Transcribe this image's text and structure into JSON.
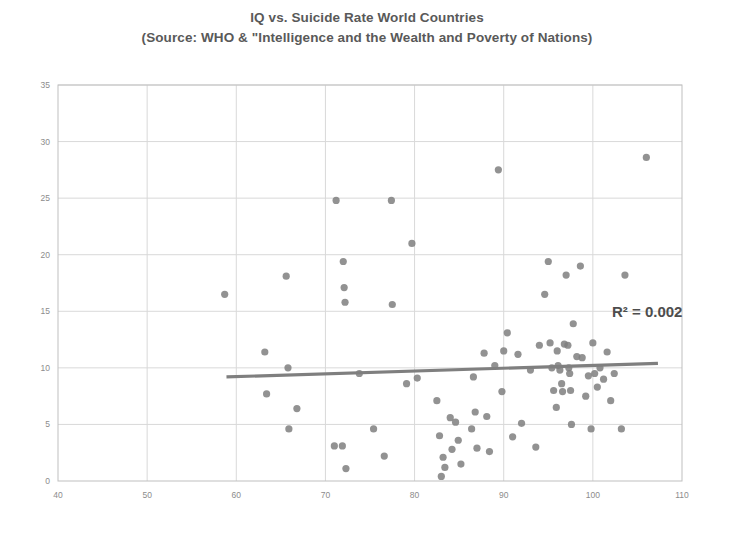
{
  "chart_data": {
    "type": "scatter",
    "title": "IQ vs. Suicide Rate World Countries",
    "subtitle": "(Source: WHO & \"Intelligence and the Wealth and Poverty of Nations)",
    "xlabel": "",
    "ylabel": "",
    "xlim": [
      40,
      110
    ],
    "ylim": [
      0,
      35
    ],
    "xticks": [
      40,
      50,
      60,
      70,
      80,
      90,
      100,
      110
    ],
    "yticks": [
      0,
      5,
      10,
      15,
      20,
      25,
      30,
      35
    ],
    "grid": true,
    "legend": false,
    "annotations": [
      {
        "text": "R² = 0.002",
        "x": 97.5,
        "y": 13.9
      }
    ],
    "marker_color": "#7f7f7f",
    "trendline": {
      "color": "#7f7f7f",
      "x0": 58.9,
      "y0": 9.2,
      "x1": 107.3,
      "y1": 10.4,
      "r_squared": 0.002
    },
    "points": [
      [
        58.7,
        16.5
      ],
      [
        63.2,
        11.4
      ],
      [
        63.4,
        7.7
      ],
      [
        65.6,
        18.1
      ],
      [
        65.8,
        10.0
      ],
      [
        65.9,
        4.6
      ],
      [
        66.8,
        6.4
      ],
      [
        71.0,
        3.1
      ],
      [
        71.2,
        24.8
      ],
      [
        71.9,
        3.1
      ],
      [
        72.0,
        19.4
      ],
      [
        72.1,
        17.1
      ],
      [
        72.2,
        15.8
      ],
      [
        72.3,
        1.1
      ],
      [
        73.8,
        9.5
      ],
      [
        75.4,
        4.6
      ],
      [
        76.6,
        2.2
      ],
      [
        77.4,
        24.8
      ],
      [
        77.5,
        15.6
      ],
      [
        79.1,
        8.6
      ],
      [
        79.7,
        21.0
      ],
      [
        80.3,
        9.1
      ],
      [
        82.5,
        7.1
      ],
      [
        82.8,
        4.0
      ],
      [
        83.0,
        0.4
      ],
      [
        83.2,
        2.1
      ],
      [
        83.4,
        1.2
      ],
      [
        84.0,
        5.6
      ],
      [
        84.2,
        2.8
      ],
      [
        84.6,
        5.2
      ],
      [
        84.9,
        3.6
      ],
      [
        85.2,
        1.5
      ],
      [
        86.4,
        4.6
      ],
      [
        86.6,
        9.2
      ],
      [
        86.8,
        6.1
      ],
      [
        87.0,
        2.9
      ],
      [
        87.8,
        11.3
      ],
      [
        88.1,
        5.7
      ],
      [
        88.4,
        2.6
      ],
      [
        89.0,
        10.2
      ],
      [
        89.4,
        27.5
      ],
      [
        89.8,
        7.9
      ],
      [
        90.0,
        11.5
      ],
      [
        90.4,
        13.1
      ],
      [
        91.0,
        3.9
      ],
      [
        91.6,
        11.2
      ],
      [
        92.0,
        5.1
      ],
      [
        93.0,
        9.8
      ],
      [
        93.6,
        3.0
      ],
      [
        94.0,
        12.0
      ],
      [
        94.6,
        16.5
      ],
      [
        95.0,
        19.4
      ],
      [
        95.2,
        12.2
      ],
      [
        95.4,
        10.0
      ],
      [
        95.6,
        8.0
      ],
      [
        95.9,
        6.5
      ],
      [
        96.0,
        11.5
      ],
      [
        96.1,
        10.2
      ],
      [
        96.3,
        9.8
      ],
      [
        96.5,
        8.6
      ],
      [
        96.6,
        7.9
      ],
      [
        96.8,
        12.1
      ],
      [
        97.0,
        18.2
      ],
      [
        97.2,
        12.0
      ],
      [
        97.3,
        10.0
      ],
      [
        97.4,
        9.5
      ],
      [
        97.5,
        8.0
      ],
      [
        97.6,
        5.0
      ],
      [
        97.8,
        13.9
      ],
      [
        98.2,
        11.0
      ],
      [
        98.6,
        19.0
      ],
      [
        98.8,
        10.9
      ],
      [
        99.2,
        7.5
      ],
      [
        99.5,
        9.3
      ],
      [
        99.8,
        4.6
      ],
      [
        100.0,
        12.2
      ],
      [
        100.2,
        9.5
      ],
      [
        100.5,
        8.3
      ],
      [
        100.8,
        10.0
      ],
      [
        101.2,
        9.0
      ],
      [
        101.6,
        11.4
      ],
      [
        102.0,
        7.1
      ],
      [
        102.4,
        9.5
      ],
      [
        103.2,
        4.6
      ],
      [
        103.6,
        18.2
      ],
      [
        106.0,
        28.6
      ]
    ]
  },
  "plot": {
    "left_px": 58,
    "right_px": 682,
    "top_px": 85,
    "bottom_px": 481
  },
  "axis": {
    "x_labels": [
      "40",
      "50",
      "60",
      "70",
      "80",
      "90",
      "100",
      "110"
    ],
    "y_labels": [
      "0",
      "5",
      "10",
      "15",
      "20",
      "25",
      "30",
      "35"
    ]
  },
  "colors": {
    "marker": "#7f7f7f",
    "trendline": "#7f7f7f",
    "grid": "#d9d9d9",
    "border": "#bfbfbf",
    "tick_text": "#8c8c8c",
    "title_text": "#595959",
    "background": "#ffffff"
  }
}
